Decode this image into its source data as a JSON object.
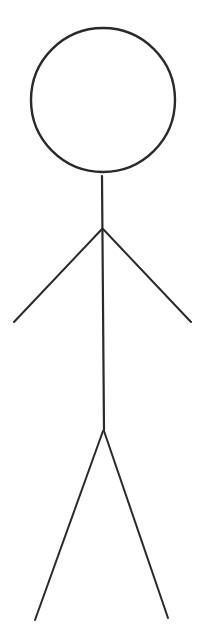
{
  "figure": {
    "stroke_color": "#2a2a2a",
    "background": "#ffffff",
    "head": {
      "cx": 103,
      "cy": 100,
      "r": 72
    },
    "body": {
      "x1": 102,
      "y1": 176,
      "x2": 104,
      "y2": 430
    },
    "left_arm": {
      "x1": 102,
      "y1": 229,
      "x2": 14,
      "y2": 322
    },
    "right_arm": {
      "x1": 103,
      "y1": 229,
      "x2": 191,
      "y2": 322
    },
    "left_leg": {
      "x1": 103,
      "y1": 431,
      "x2": 35,
      "y2": 620
    },
    "right_leg": {
      "x1": 104,
      "y1": 431,
      "x2": 168,
      "y2": 618
    }
  }
}
